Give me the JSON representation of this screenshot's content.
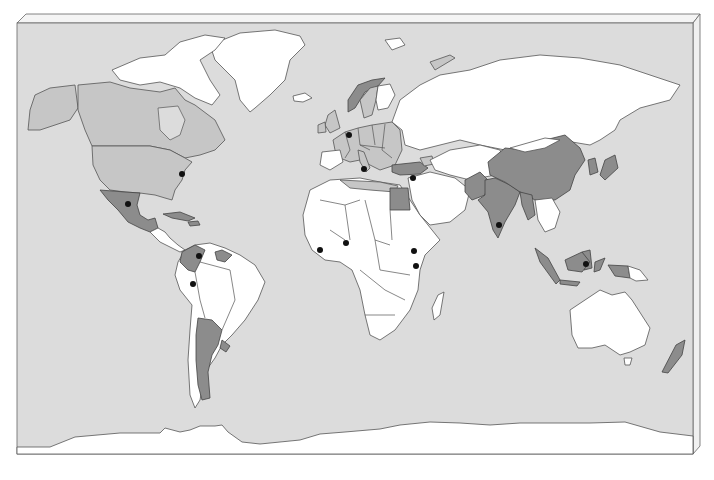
{
  "map": {
    "title": "",
    "colors": {
      "background": "#ffffff",
      "ocean": "#dcdcdc",
      "land_unshaded": "#ffffff",
      "land_light": "#c6c6c6",
      "land_dark": "#8c8c8c",
      "outline": "#555555",
      "marker": "#111111"
    },
    "frame": {
      "left": 17,
      "top": 23,
      "right": 693,
      "bottom": 454,
      "bevel": 8
    },
    "regions_light": [
      "Canada",
      "United States",
      "Sweden",
      "United Kingdom",
      "France",
      "Germany",
      "Poland",
      "Central Europe",
      "Balkans",
      "Spain (partial)",
      "Mediterranean North Africa coast",
      "Ukraine (partial)",
      "Caucasus",
      "Korea (North)"
    ],
    "regions_dark": [
      "Mexico",
      "Cuba",
      "Colombia",
      "Guyana",
      "Suriname",
      "Argentina",
      "Uruguay",
      "Norway",
      "Turkey",
      "Egypt",
      "Pakistan",
      "India",
      "China",
      "Bangladesh",
      "Myanmar",
      "South Korea",
      "Japan",
      "Philippines",
      "Malaysia",
      "Indonesia",
      "Papua",
      "New Zealand"
    ],
    "markers": [
      {
        "label": "Washington",
        "x": 182,
        "y": 174
      },
      {
        "label": "Mexico",
        "x": 128,
        "y": 204
      },
      {
        "label": "Colombia",
        "x": 199,
        "y": 256
      },
      {
        "label": "Peru",
        "x": 193,
        "y": 284
      },
      {
        "label": "Brussels",
        "x": 349,
        "y": 135
      },
      {
        "label": "Rome",
        "x": 364,
        "y": 169
      },
      {
        "label": "Levant",
        "x": 413,
        "y": 178
      },
      {
        "label": "Sierra Leone",
        "x": 320,
        "y": 250
      },
      {
        "label": "Ghana",
        "x": 346,
        "y": 243
      },
      {
        "label": "Ethiopia",
        "x": 414,
        "y": 251
      },
      {
        "label": "Kenya",
        "x": 416,
        "y": 266
      },
      {
        "label": "India",
        "x": 499,
        "y": 225
      },
      {
        "label": "Philippines",
        "x": 586,
        "y": 264
      }
    ]
  }
}
